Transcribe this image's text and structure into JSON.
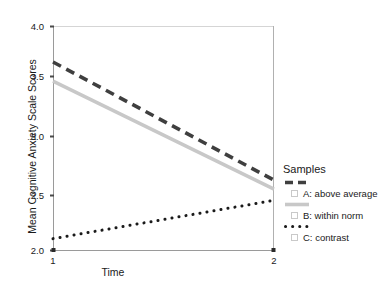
{
  "chart_data": {
    "type": "line",
    "title": "",
    "xlabel": "Time",
    "ylabel": "Mean Cognitive Anxiety Scale Scores",
    "x": [
      1,
      2
    ],
    "xtick_labels": [
      "1",
      "2"
    ],
    "ytick_labels": [
      "2.0",
      "2.5",
      "3.0",
      "3.5",
      "4.0"
    ],
    "ytick_values": [
      2.0,
      2.5,
      3.0,
      3.5,
      4.0
    ],
    "xlim": [
      1,
      2
    ],
    "ylim": [
      2.0,
      4.0
    ],
    "grid": false,
    "legend_position": "right",
    "legend_title": "Samples",
    "series": [
      {
        "name": "A: above average",
        "values": [
          3.68,
          2.63
        ],
        "style": "dashed",
        "color": "#3f3f3f"
      },
      {
        "name": "B: within norm",
        "values": [
          3.51,
          2.55
        ],
        "style": "solid",
        "color": "#c8c8c8"
      },
      {
        "name": "C: contrast",
        "values": [
          2.11,
          2.45
        ],
        "style": "dotted",
        "color": "#1a1a1a"
      }
    ]
  },
  "legend": {
    "title": "Samples",
    "entries": [
      {
        "label": "A: above average"
      },
      {
        "label": "B: within norm"
      },
      {
        "label": "C: contrast"
      }
    ]
  },
  "axes": {
    "x_title": "Time",
    "y_title": "Mean Cognitive Anxiety Scale Scores",
    "x_ticks": [
      "1",
      "2"
    ],
    "y_ticks": [
      "2.0",
      "2.5",
      "3.0",
      "3.5",
      "4.0"
    ]
  },
  "colors": {
    "series_a": "#3f3f3f",
    "series_b": "#c8c8c8",
    "series_c": "#1a1a1a",
    "axis": "#9a9a9a",
    "text": "#1a1a1a",
    "background": "#ffffff"
  }
}
